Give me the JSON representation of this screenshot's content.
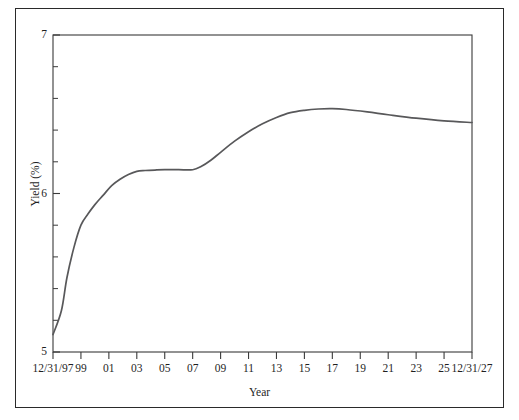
{
  "figure": {
    "background_color": "#ffffff",
    "frame_color": "#2a2a2a",
    "axis_color": "#3a3a3a",
    "line_color": "#58585a"
  },
  "chart_data": {
    "type": "line",
    "title": "",
    "subtitle": "",
    "xlabel": "Year",
    "ylabel": "Yield (%)",
    "xlim": [
      1997,
      2027
    ],
    "ylim": [
      5,
      7
    ],
    "grid": false,
    "legend": null,
    "x_tick_labels": [
      "12/31/97",
      "99",
      "01",
      "03",
      "05",
      "07",
      "09",
      "11",
      "13",
      "15",
      "17",
      "19",
      "21",
      "23",
      "25",
      "12/31/27"
    ],
    "x_tick_values": [
      1997,
      1999,
      2001,
      2003,
      2005,
      2007,
      2009,
      2011,
      2013,
      2015,
      2017,
      2019,
      2021,
      2023,
      2025,
      2027
    ],
    "y_tick_labels": [
      "5",
      "6",
      "7"
    ],
    "y_tick_values": [
      5,
      6,
      7
    ],
    "y_minor_tick_values": [
      5.2,
      5.4,
      5.6,
      5.8,
      6.2,
      6.4,
      6.6,
      6.8
    ],
    "series": [
      {
        "name": "Yield",
        "x": [
          1997.0,
          1997.6,
          1998.0,
          1998.5,
          1999.0,
          1999.5,
          2000.0,
          2000.6,
          2001.2,
          2001.8,
          2002.4,
          2003.0,
          2003.6,
          2004.3,
          2005.0,
          2006.0,
          2007.0,
          2007.6,
          2008.3,
          2009.0,
          2010.0,
          2011.0,
          2012.0,
          2013.0,
          2014.0,
          2015.0,
          2016.0,
          2017.0,
          2018.0,
          2019.5,
          2021.0,
          2023.0,
          2025.0,
          2027.0
        ],
        "y": [
          5.11,
          5.26,
          5.47,
          5.66,
          5.8,
          5.87,
          5.93,
          5.99,
          6.05,
          6.09,
          6.12,
          6.14,
          6.145,
          6.148,
          6.15,
          6.15,
          6.15,
          6.17,
          6.21,
          6.26,
          6.33,
          6.39,
          6.44,
          6.48,
          6.51,
          6.525,
          6.533,
          6.535,
          6.53,
          6.515,
          6.497,
          6.475,
          6.458,
          6.448
        ]
      }
    ]
  }
}
